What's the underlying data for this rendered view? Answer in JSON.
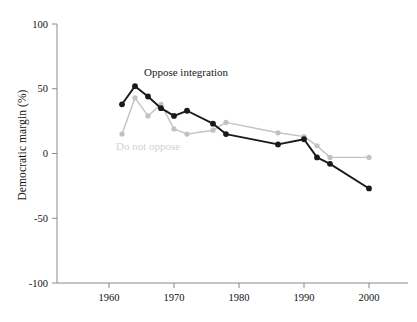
{
  "figure": {
    "background_color": "#ffffff",
    "width": 417,
    "height": 322
  },
  "axis": {
    "y_title": "Democratic margin (%)",
    "y_ticks": [
      "100",
      "50",
      "0",
      "-50",
      "-100"
    ],
    "x_ticks": [
      "1960",
      "1970",
      "1980",
      "1990",
      "2000"
    ],
    "axis_color": "#8a8a8a"
  },
  "annotations": {
    "oppose_label": "Oppose integration",
    "do_not_oppose_label": "Do not oppose"
  },
  "chart_data": {
    "type": "line",
    "title": "",
    "xlabel": "",
    "ylabel": "Democratic margin (%)",
    "xlim": [
      1952,
      2006
    ],
    "ylim": [
      -100,
      100
    ],
    "yticks": [
      100,
      50,
      0,
      -50,
      -100
    ],
    "xticks": [
      1960,
      1970,
      1980,
      1990,
      2000
    ],
    "grid": false,
    "legend": "inline-annotations",
    "series": [
      {
        "name": "Oppose integration",
        "color": "#1a1a1a",
        "marker": "circle",
        "x": [
          1962,
          1964,
          1966,
          1968,
          1970,
          1972,
          1976,
          1978,
          1986,
          1990,
          1992,
          1994,
          2000
        ],
        "values": [
          38,
          52,
          44,
          35,
          29,
          33,
          23,
          15,
          7,
          11,
          -3,
          -8,
          -27
        ]
      },
      {
        "name": "Do not oppose",
        "color": "#c2c2c2",
        "marker": "circle",
        "x": [
          1962,
          1964,
          1966,
          1968,
          1970,
          1972,
          1976,
          1978,
          1986,
          1990,
          1992,
          1994,
          2000
        ],
        "values": [
          15,
          43,
          29,
          38,
          19,
          15,
          18,
          24,
          16,
          13,
          6,
          -3,
          -3
        ]
      }
    ]
  }
}
